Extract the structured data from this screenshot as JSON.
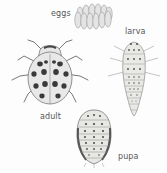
{
  "figure": {
    "stages": [
      {
        "id": "eggs",
        "label": "eggs"
      },
      {
        "id": "larva",
        "label": "larva"
      },
      {
        "id": "adult",
        "label": "adult"
      },
      {
        "id": "pupa",
        "label": "pupa"
      }
    ]
  }
}
